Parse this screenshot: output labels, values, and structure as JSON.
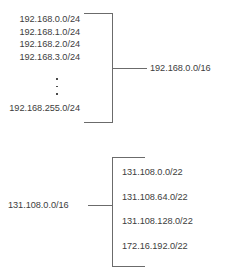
{
  "figure": {
    "type": "cidr-aggregation-diagram",
    "background_color": "#ffffff",
    "line_color": "#6b6b6b",
    "text_color": "#3d3d3d"
  },
  "groups": {
    "aggregate": {
      "name": "route-aggregation-group",
      "direction": "members-left-summary-right",
      "members": [
        {
          "cidr": "192.168.0.0/24"
        },
        {
          "cidr": "192.168.1.0/24"
        },
        {
          "cidr": "192.168.2.0/24"
        },
        {
          "cidr": "192.168.3.0/24"
        }
      ],
      "continuation": "vertical-ellipsis",
      "continuation_dots": 3,
      "last_member": {
        "cidr": "192.168.255.0/24"
      },
      "summary": {
        "cidr": "192.168.0.0/16"
      }
    },
    "decompose": {
      "name": "route-decomposition-group",
      "direction": "summary-left-members-right",
      "summary": {
        "cidr": "131.108.0.0/16"
      },
      "members": [
        {
          "cidr": "131.108.0.0/22"
        },
        {
          "cidr": "131.108.64.0/22"
        },
        {
          "cidr": "131.108.128.0/22"
        },
        {
          "cidr": "172.16.192.0/22"
        }
      ]
    }
  }
}
